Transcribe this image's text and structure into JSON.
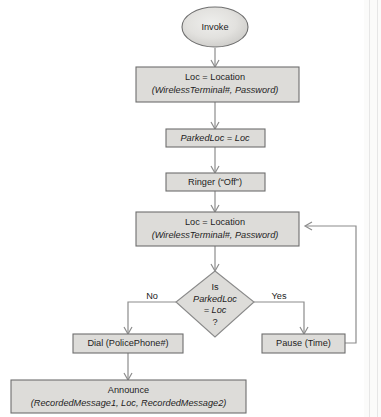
{
  "diagram": {
    "type": "flowchart",
    "colors": {
      "shape_fill": "#dddcd9",
      "shape_border": "#6e6e6e",
      "connector": "#8c8c8c",
      "text": "#1d1d1d",
      "background": "#ffffff"
    },
    "nodes": {
      "start": {
        "shape": "oval",
        "label": "Invoke"
      },
      "location1": {
        "shape": "process",
        "line1_italic": "Loc",
        "line1_rest": " = Location",
        "line2": "(WirelessTerminal#, Password)"
      },
      "parked_loc": {
        "shape": "process",
        "label": "ParkedLoc = Loc"
      },
      "ringer": {
        "shape": "process",
        "label": "Ringer (“Off”)"
      },
      "location2": {
        "shape": "process",
        "line1_italic": "Loc",
        "line1_rest": " = Location",
        "line2": "(WirelessTerminal#, Password)"
      },
      "decision": {
        "shape": "diamond",
        "line1": "Is",
        "line2": "ParkedLoc",
        "line3": "= Loc",
        "line4": "?"
      },
      "dial": {
        "shape": "process",
        "label_upright": "Dial (",
        "label_italic": "PolicePhone#",
        "label_close": ")"
      },
      "pause": {
        "shape": "process",
        "label_upright": "Pause (",
        "label_italic": "Time",
        "label_close": ")"
      },
      "announce": {
        "shape": "process",
        "line1": "Announce",
        "line2": "(RecordedMessage1, Loc, RecordedMessage2)"
      }
    },
    "branches": {
      "no_label": "No",
      "yes_label": "Yes"
    }
  }
}
